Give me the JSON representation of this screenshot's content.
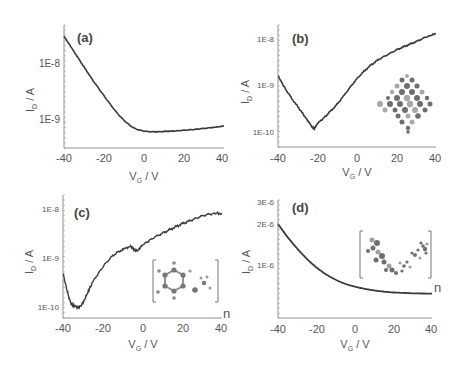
{
  "figure": {
    "panels": [
      "a",
      "b",
      "c",
      "d"
    ]
  },
  "chart_data": [
    {
      "id": "a",
      "type": "line",
      "label": "(a)",
      "xlabel": "V_G / V",
      "ylabel": "I_D / A",
      "yscale": "log",
      "xlim": [
        -40,
        40
      ],
      "ylim": [
        3.5e-10,
        4e-08
      ],
      "xticks": [
        -40,
        -20,
        0,
        20,
        40
      ],
      "yticks": [
        {
          "value": 1e-09,
          "label": "1E-9"
        },
        {
          "value": 1e-08,
          "label": "1E-8"
        }
      ],
      "x": [
        -40,
        -35,
        -30,
        -25,
        -20,
        -15,
        -10,
        -5,
        0,
        5,
        10,
        15,
        20,
        25,
        30,
        35,
        40
      ],
      "y": [
        3e-08,
        1.6e-08,
        8.5e-09,
        4.6e-09,
        2.6e-09,
        1.5e-09,
        9.5e-10,
        6.9e-10,
        6.1e-10,
        5.9e-10,
        6e-10,
        6.1e-10,
        6.3e-10,
        6.5e-10,
        6.8e-10,
        7.1e-10,
        7.5e-10
      ]
    },
    {
      "id": "b",
      "type": "line",
      "label": "(b)",
      "xlabel": "V_G / V",
      "ylabel": "I_D / A",
      "yscale": "log",
      "xlim": [
        -40,
        40
      ],
      "ylim": [
        5e-11,
        1.6e-08
      ],
      "xticks": [
        -40,
        -20,
        0,
        20,
        40
      ],
      "yticks": [
        {
          "value": 1e-10,
          "label": "1E-10"
        },
        {
          "value": 1e-09,
          "label": "1E-9"
        },
        {
          "value": 1e-08,
          "label": "1E-8"
        }
      ],
      "x": [
        -40,
        -35,
        -30,
        -25,
        -22,
        -20,
        -15,
        -10,
        -5,
        0,
        5,
        10,
        15,
        20,
        25,
        30,
        35,
        40
      ],
      "y": [
        1.6e-09,
        7e-10,
        3.5e-10,
        1.8e-10,
        1.2e-10,
        1.5e-10,
        2.4e-10,
        4e-10,
        7.5e-10,
        1.4e-09,
        2.3e-09,
        3.4e-09,
        4.5e-09,
        5.8e-09,
        7.2e-09,
        8.8e-09,
        1.1e-08,
        1.3e-08
      ],
      "inset": "molecular structure (fused aromatic network)"
    },
    {
      "id": "c",
      "type": "line",
      "label": "(c)",
      "xlabel": "V_G / V",
      "ylabel": "I_D / A",
      "yscale": "log",
      "xlim": [
        -40,
        40
      ],
      "ylim": [
        7e-11,
        1.4e-08
      ],
      "xticks": [
        -40,
        -20,
        0,
        20,
        40
      ],
      "yticks": [
        {
          "value": 1e-10,
          "label": "1E-10"
        },
        {
          "value": 1e-09,
          "label": "1E-9"
        },
        {
          "value": 1e-08,
          "label": "1E-8"
        }
      ],
      "x": [
        -40,
        -38,
        -36,
        -34,
        -32,
        -30,
        -28,
        -25,
        -20,
        -15,
        -10,
        -6,
        -3,
        0,
        5,
        10,
        15,
        20,
        25,
        30,
        35,
        40
      ],
      "y": [
        5e-10,
        2.2e-10,
        1.2e-10,
        1.05e-10,
        1e-10,
        1.2e-10,
        1.8e-10,
        3.2e-10,
        6.5e-10,
        1.1e-09,
        1.5e-09,
        1.7e-09,
        1.4e-09,
        1.8e-09,
        2.5e-09,
        3.2e-09,
        4e-09,
        5e-09,
        6e-09,
        7.2e-09,
        8e-09,
        8.2e-09
      ],
      "inset": "polymer repeat unit [ ]n with substituted benzene ring",
      "inset_subscript": "n"
    },
    {
      "id": "d",
      "type": "line",
      "label": "(d)",
      "xlabel": "V_G / V",
      "ylabel": "I_D / A",
      "yscale": "linear",
      "xlim": [
        -40,
        40
      ],
      "ylim": [
        0,
        3e-06
      ],
      "xticks": [
        -40,
        -20,
        0,
        20,
        40
      ],
      "yticks": [
        {
          "value": 1e-06,
          "label": "1E-6"
        },
        {
          "value": 2e-06,
          "label": "2E-6"
        },
        {
          "value": 3e-06,
          "label": "3E-6"
        }
      ],
      "x": [
        -40,
        -35,
        -30,
        -25,
        -20,
        -15,
        -10,
        -5,
        0,
        5,
        10,
        15,
        20,
        25,
        30,
        35,
        40
      ],
      "y": [
        2e-06,
        1.68e-06,
        1.4e-06,
        1.15e-06,
        9.4e-07,
        7.7e-07,
        6.4e-07,
        5.4e-07,
        4.7e-07,
        4.2e-07,
        3.8e-07,
        3.5e-07,
        3.3e-07,
        3.2e-07,
        3.1e-07,
        3.05e-07,
        3e-07
      ],
      "inset": "polymer repeat unit [ ]n",
      "inset_subscript": "n"
    }
  ],
  "labels": {
    "a": "(a)",
    "b": "(b)",
    "c": "(c)",
    "d": "(d)",
    "ylabel_main": "I",
    "ylabel_sub": "D",
    "ylabel_tail": " / A",
    "xlabel_main": "V",
    "xlabel_sub": "G",
    "xlabel_tail": " / V",
    "n": "n",
    "tick_m40": "-40",
    "tick_m20": "-20",
    "tick_0": "0",
    "tick_20": "20",
    "tick_40": "40",
    "y_1e8": "1E-8",
    "y_1e9": "1E-9",
    "y_1e10": "1E-10",
    "y_1e6": "1E-6",
    "y_2e6": "2E-6",
    "y_3e6": "3E-6"
  },
  "colors": {
    "curve": "#3a3a3a",
    "axis": "#666666",
    "text": "#555555",
    "inset_dark": "#6a6a6a",
    "inset_light": "#a8a8a8"
  }
}
